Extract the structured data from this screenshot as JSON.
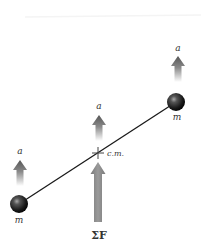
{
  "diagram": {
    "masses": [
      {
        "id": "left",
        "label": "m",
        "cx": 19,
        "cy": 204,
        "r": 9
      },
      {
        "id": "right",
        "label": "m",
        "cx": 176,
        "cy": 102,
        "r": 9
      }
    ],
    "rod": {
      "x1": 19,
      "y1": 204,
      "x2": 176,
      "y2": 102,
      "color": "#1a1a1a"
    },
    "center_of_mass": {
      "label": "c.m.",
      "x": 98,
      "y": 153
    },
    "acceleration_arrows": [
      {
        "id": "left",
        "label": "a",
        "x": 20,
        "tip_y": 160,
        "tail_y": 186
      },
      {
        "id": "middle",
        "label": "a",
        "x": 99,
        "tip_y": 115,
        "tail_y": 141
      },
      {
        "id": "right",
        "label": "a",
        "x": 178,
        "tip_y": 56,
        "tail_y": 82
      }
    ],
    "net_force_arrow": {
      "label": "ΣF",
      "x": 98,
      "tip_y": 162,
      "tail_y": 222,
      "color": "#888888"
    },
    "colors": {
      "arrow_head": "#5a5a5a",
      "arrow_fade": "#ffffff",
      "ball_dark": "#111111",
      "ball_highlight": "#9a9a9a"
    }
  }
}
